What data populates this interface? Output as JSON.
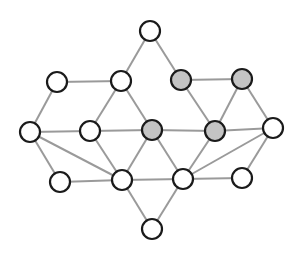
{
  "diagram": {
    "type": "undirected-graph",
    "colors": {
      "node_default": "#ffffff",
      "node_highlight": "#c4c4c4",
      "node_stroke": "#1a1a1a",
      "edge": "#9a9a9a",
      "background": "#ffffff"
    },
    "node_radius": 10,
    "nodes": [
      {
        "id": "n1",
        "x": 150,
        "y": 31,
        "highlighted": false
      },
      {
        "id": "n2",
        "x": 57,
        "y": 82,
        "highlighted": false
      },
      {
        "id": "n3",
        "x": 121,
        "y": 81,
        "highlighted": false
      },
      {
        "id": "n4",
        "x": 181,
        "y": 80,
        "highlighted": true
      },
      {
        "id": "n5",
        "x": 242,
        "y": 79,
        "highlighted": true
      },
      {
        "id": "n6",
        "x": 30,
        "y": 132,
        "highlighted": false
      },
      {
        "id": "n7",
        "x": 90,
        "y": 131,
        "highlighted": false
      },
      {
        "id": "n8",
        "x": 152,
        "y": 130,
        "highlighted": true
      },
      {
        "id": "n9",
        "x": 215,
        "y": 131,
        "highlighted": true
      },
      {
        "id": "n10",
        "x": 273,
        "y": 128,
        "highlighted": false
      },
      {
        "id": "n11",
        "x": 60,
        "y": 182,
        "highlighted": false
      },
      {
        "id": "n12",
        "x": 122,
        "y": 180,
        "highlighted": false
      },
      {
        "id": "n13",
        "x": 183,
        "y": 179,
        "highlighted": false
      },
      {
        "id": "n14",
        "x": 242,
        "y": 178,
        "highlighted": false
      },
      {
        "id": "n15",
        "x": 152,
        "y": 229,
        "highlighted": false
      }
    ],
    "edges": [
      [
        "n1",
        "n3"
      ],
      [
        "n1",
        "n4"
      ],
      [
        "n2",
        "n3"
      ],
      [
        "n2",
        "n6"
      ],
      [
        "n3",
        "n7"
      ],
      [
        "n3",
        "n8"
      ],
      [
        "n4",
        "n5"
      ],
      [
        "n4",
        "n9"
      ],
      [
        "n5",
        "n9"
      ],
      [
        "n5",
        "n10"
      ],
      [
        "n6",
        "n7"
      ],
      [
        "n6",
        "n11"
      ],
      [
        "n6",
        "n12"
      ],
      [
        "n7",
        "n8"
      ],
      [
        "n7",
        "n12"
      ],
      [
        "n8",
        "n9"
      ],
      [
        "n8",
        "n12"
      ],
      [
        "n8",
        "n13"
      ],
      [
        "n9",
        "n10"
      ],
      [
        "n9",
        "n13"
      ],
      [
        "n10",
        "n13"
      ],
      [
        "n10",
        "n14"
      ],
      [
        "n11",
        "n12"
      ],
      [
        "n12",
        "n13"
      ],
      [
        "n12",
        "n15"
      ],
      [
        "n13",
        "n14"
      ],
      [
        "n13",
        "n15"
      ]
    ]
  }
}
